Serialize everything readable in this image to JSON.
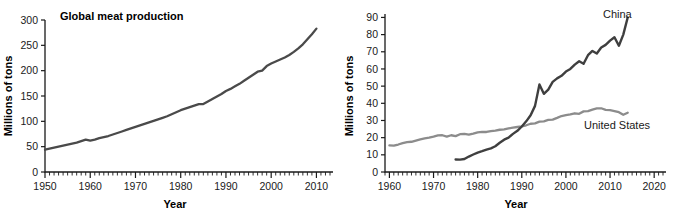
{
  "figure": {
    "panels": [
      "left",
      "right"
    ],
    "background": "#ffffff"
  },
  "left_panel": {
    "title": "Global meat production",
    "ylabel": "Millions of tons",
    "xlabel": "Year",
    "y_ticks": [
      "0",
      "50",
      "100",
      "150",
      "200",
      "250",
      "300"
    ],
    "x_ticks": [
      "1950",
      "1960",
      "1970",
      "1980",
      "1990",
      "2000",
      "2010"
    ],
    "line_color": "#4a4a4a"
  },
  "right_panel": {
    "ylabel": "Millions of tons",
    "xlabel": "Year",
    "y_ticks": [
      "0",
      "10",
      "20",
      "30",
      "40",
      "50",
      "60",
      "70",
      "80",
      "90"
    ],
    "x_ticks": [
      "1960",
      "1970",
      "1980",
      "1990",
      "2000",
      "2010",
      "2020"
    ],
    "series_labels": {
      "china": "China",
      "united_states": "United States"
    },
    "china_color": "#3f3f3f",
    "us_color": "#8c8c8c"
  },
  "chart_data": [
    {
      "type": "line",
      "title": "Global meat production",
      "xlabel": "Year",
      "ylabel": "Millions of tons",
      "xlim": [
        1950,
        2013
      ],
      "ylim": [
        0,
        300
      ],
      "xticks": [
        1950,
        1960,
        1970,
        1980,
        1990,
        2000,
        2010
      ],
      "yticks": [
        0,
        50,
        100,
        150,
        200,
        250,
        300
      ],
      "grid": false,
      "legend": "none",
      "series": [
        {
          "name": "Global meat production",
          "color": "#4a4a4a",
          "x": [
            1950,
            1951,
            1952,
            1953,
            1954,
            1955,
            1956,
            1957,
            1958,
            1959,
            1960,
            1961,
            1962,
            1963,
            1964,
            1965,
            1966,
            1967,
            1968,
            1969,
            1970,
            1971,
            1972,
            1973,
            1974,
            1975,
            1976,
            1977,
            1978,
            1979,
            1980,
            1981,
            1982,
            1983,
            1984,
            1985,
            1986,
            1987,
            1988,
            1989,
            1990,
            1991,
            1992,
            1993,
            1994,
            1995,
            1996,
            1997,
            1998,
            1999,
            2000,
            2001,
            2002,
            2003,
            2004,
            2005,
            2006,
            2007,
            2008,
            2009,
            2010
          ],
          "values": [
            44,
            46,
            48,
            50,
            52,
            54,
            56,
            58,
            61,
            64,
            62,
            64,
            67,
            69,
            71,
            74,
            77,
            80,
            83,
            86,
            89,
            92,
            95,
            98,
            101,
            104,
            107,
            110,
            114,
            118,
            122,
            125,
            128,
            131,
            134,
            134,
            139,
            144,
            149,
            154,
            160,
            164,
            169,
            174,
            180,
            186,
            192,
            198,
            200,
            209,
            214,
            218,
            222,
            226,
            231,
            237,
            244,
            252,
            262,
            272,
            283
          ]
        }
      ]
    },
    {
      "type": "line",
      "title": "",
      "xlabel": "Year",
      "ylabel": "Millions of tons",
      "xlim": [
        1959,
        2022
      ],
      "ylim": [
        0,
        92
      ],
      "xticks": [
        1960,
        1970,
        1980,
        1990,
        2000,
        2010,
        2020
      ],
      "yticks": [
        0,
        10,
        20,
        30,
        40,
        50,
        60,
        70,
        80,
        90
      ],
      "grid": false,
      "legend": "inline-labels",
      "series": [
        {
          "name": "China",
          "color": "#3f3f3f",
          "x": [
            1975,
            1976,
            1977,
            1978,
            1979,
            1980,
            1981,
            1982,
            1983,
            1984,
            1985,
            1986,
            1987,
            1988,
            1989,
            1990,
            1991,
            1992,
            1993,
            1994,
            1995,
            1996,
            1997,
            1998,
            1999,
            2000,
            2001,
            2002,
            2003,
            2004,
            2005,
            2006,
            2007,
            2008,
            2009,
            2010,
            2011,
            2012,
            2013,
            2014
          ],
          "values": [
            7.3,
            7.2,
            7.6,
            9.0,
            10.2,
            11.3,
            12.1,
            13.0,
            13.8,
            15.0,
            17.0,
            18.8,
            20.0,
            22.2,
            24.0,
            26.5,
            29.5,
            33.0,
            38.5,
            51.0,
            45.5,
            48.0,
            52.5,
            54.5,
            56.0,
            58.5,
            60.0,
            62.5,
            64.5,
            63.0,
            68.0,
            70.5,
            69.0,
            72.5,
            74.0,
            76.5,
            78.5,
            73.5,
            80.0,
            90.0
          ]
        },
        {
          "name": "United States",
          "color": "#8c8c8c",
          "x": [
            1960,
            1961,
            1962,
            1963,
            1964,
            1965,
            1966,
            1967,
            1968,
            1969,
            1970,
            1971,
            1972,
            1973,
            1974,
            1975,
            1976,
            1977,
            1978,
            1979,
            1980,
            1981,
            1982,
            1983,
            1984,
            1985,
            1986,
            1987,
            1988,
            1989,
            1990,
            1991,
            1992,
            1993,
            1994,
            1995,
            1996,
            1997,
            1998,
            1999,
            2000,
            2001,
            2002,
            2003,
            2004,
            2005,
            2006,
            2007,
            2008,
            2009,
            2010,
            2011,
            2012,
            2013,
            2014
          ],
          "values": [
            15.5,
            15.3,
            16.0,
            16.8,
            17.4,
            17.6,
            18.3,
            19.0,
            19.6,
            20.0,
            20.6,
            21.3,
            21.4,
            20.6,
            21.4,
            20.9,
            22.0,
            22.2,
            21.8,
            22.4,
            23.1,
            23.4,
            23.3,
            23.8,
            24.1,
            24.6,
            24.8,
            25.4,
            25.8,
            26.2,
            26.6,
            27.2,
            28.1,
            28.3,
            29.3,
            29.5,
            30.3,
            30.5,
            31.5,
            32.6,
            33.1,
            33.5,
            34.2,
            33.9,
            35.3,
            35.4,
            36.3,
            37.0,
            37.1,
            36.2,
            36.0,
            35.5,
            34.8,
            33.3,
            34.5
          ]
        }
      ]
    }
  ]
}
